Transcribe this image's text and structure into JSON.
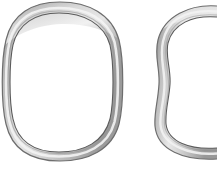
{
  "figure": {
    "kind": "anatomical-illustration",
    "background_color": "#ffffff",
    "panels": [
      {
        "id": "normal",
        "caption_lines": [
          "normal"
        ],
        "shape": "closed rounded oval ring",
        "clipped": false
      },
      {
        "id": "tracheomalacia",
        "caption_lines": [
          "trachea",
          "(cartilage"
        ],
        "shape": "deformed ring with concave lateral wall, clipped at right image edge",
        "clipped": true
      }
    ]
  },
  "colors": {
    "outline_dark": "#6e6e6e",
    "outline_darkest": "#4a4a4a",
    "band_mid": "#a9a9a9",
    "band_light": "#d7d7d7",
    "band_highlight": "#efefef",
    "inner_fill": "#ffffff",
    "caption_text": "#1b1b1b"
  }
}
